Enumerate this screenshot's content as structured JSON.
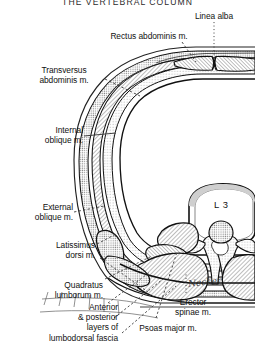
{
  "page": {
    "title": "THE VERTEBRAL COLUMN",
    "signature": "Necker"
  },
  "figure": {
    "type": "anatomical-cross-section",
    "vertebra_label": "L 3"
  },
  "labels": [
    {
      "id": "linea-alba",
      "text": "Linea alba",
      "align": "center"
    },
    {
      "id": "rectus-abdominis",
      "text": "Rectus abdominis m.",
      "align": "center"
    },
    {
      "id": "transversus",
      "text": "Transversus\nabdominis m.",
      "align": "center"
    },
    {
      "id": "internal-oblique",
      "text": "Internal\noblique m.",
      "align": "right"
    },
    {
      "id": "external-oblique",
      "text": "External\noblique m.",
      "align": "right"
    },
    {
      "id": "latissimus-dorsi",
      "text": "Latissimus\ndorsi m.",
      "align": "right"
    },
    {
      "id": "quadratus",
      "text": "Quadratus\nlumborum m.",
      "align": "right"
    },
    {
      "id": "lumbodorsal",
      "text": "Anterior\n& posterior\nlayers of\nlumbodorsal fascia",
      "align": "right"
    },
    {
      "id": "erector-spinae",
      "text": "Erector\nspinae m.",
      "align": "center"
    },
    {
      "id": "psoas-major",
      "text": "Psoas major m.",
      "align": "center"
    }
  ],
  "colors": {
    "ink": "#111111",
    "paper": "#ffffff",
    "muscle_fill": "#b9b9b9",
    "fascia_fill": "#d8d8d8",
    "bone_fill": "#fbfbfb",
    "leader": "#3a3a3a"
  }
}
